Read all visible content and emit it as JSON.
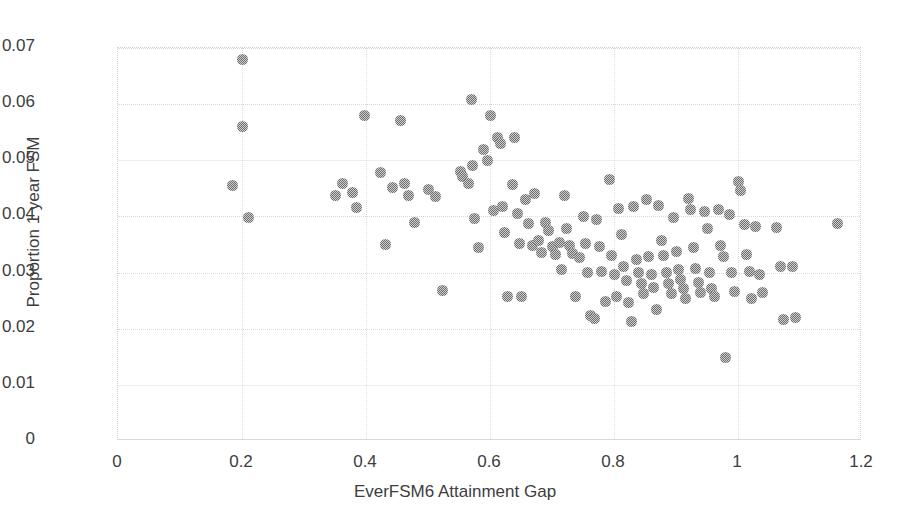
{
  "chart_data": {
    "type": "scatter",
    "title": "",
    "xlabel": "EverFSM6 Attainment Gap",
    "ylabel": "Proportion 1 year FSM",
    "xlim": [
      0,
      1.2
    ],
    "ylim": [
      0,
      0.07
    ],
    "xticks": [
      "0",
      "0.2",
      "0.4",
      "0.6",
      "0.8",
      "1",
      "1.2"
    ],
    "xtick_values": [
      0,
      0.2,
      0.4,
      0.6,
      0.8,
      1.0,
      1.2
    ],
    "yticks": [
      "0",
      "0.01",
      "0.02",
      "0.03",
      "0.04",
      "0.05",
      "0.06",
      "0.07"
    ],
    "ytick_values": [
      0,
      0.01,
      0.02,
      0.03,
      0.04,
      0.05,
      0.06,
      0.07
    ],
    "grid": true,
    "legend": false,
    "marker_color": "#6e6e6e",
    "marker_size_px": 11,
    "background_color": "#ffffff",
    "points": [
      [
        0.2,
        0.068
      ],
      [
        0.2,
        0.056
      ],
      [
        0.185,
        0.0455
      ],
      [
        0.211,
        0.0398
      ],
      [
        0.35,
        0.0438
      ],
      [
        0.362,
        0.0458
      ],
      [
        0.378,
        0.0443
      ],
      [
        0.385,
        0.0416
      ],
      [
        0.398,
        0.058
      ],
      [
        0.424,
        0.0478
      ],
      [
        0.432,
        0.035
      ],
      [
        0.443,
        0.0452
      ],
      [
        0.456,
        0.057
      ],
      [
        0.462,
        0.0458
      ],
      [
        0.468,
        0.0438
      ],
      [
        0.478,
        0.039
      ],
      [
        0.5,
        0.0448
      ],
      [
        0.512,
        0.0435
      ],
      [
        0.524,
        0.0268
      ],
      [
        0.552,
        0.048
      ],
      [
        0.556,
        0.0472
      ],
      [
        0.566,
        0.0459
      ],
      [
        0.572,
        0.049
      ],
      [
        0.57,
        0.0608
      ],
      [
        0.575,
        0.0396
      ],
      [
        0.582,
        0.0345
      ],
      [
        0.59,
        0.052
      ],
      [
        0.596,
        0.05
      ],
      [
        0.601,
        0.058
      ],
      [
        0.605,
        0.041
      ],
      [
        0.612,
        0.054
      ],
      [
        0.617,
        0.053
      ],
      [
        0.62,
        0.0418
      ],
      [
        0.624,
        0.0372
      ],
      [
        0.628,
        0.0258
      ],
      [
        0.636,
        0.0456
      ],
      [
        0.64,
        0.054
      ],
      [
        0.645,
        0.0405
      ],
      [
        0.648,
        0.0352
      ],
      [
        0.651,
        0.0258
      ],
      [
        0.658,
        0.043
      ],
      [
        0.662,
        0.0388
      ],
      [
        0.668,
        0.0349
      ],
      [
        0.672,
        0.044
      ],
      [
        0.678,
        0.0357
      ],
      [
        0.683,
        0.0336
      ],
      [
        0.69,
        0.039
      ],
      [
        0.695,
        0.0375
      ],
      [
        0.7,
        0.0346
      ],
      [
        0.706,
        0.0332
      ],
      [
        0.712,
        0.0353
      ],
      [
        0.716,
        0.0305
      ],
      [
        0.72,
        0.0437
      ],
      [
        0.724,
        0.0378
      ],
      [
        0.728,
        0.0348
      ],
      [
        0.733,
        0.0334
      ],
      [
        0.738,
        0.0258
      ],
      [
        0.744,
        0.0327
      ],
      [
        0.75,
        0.04
      ],
      [
        0.754,
        0.0352
      ],
      [
        0.758,
        0.03
      ],
      [
        0.762,
        0.0224
      ],
      [
        0.768,
        0.0218
      ],
      [
        0.772,
        0.0395
      ],
      [
        0.776,
        0.0347
      ],
      [
        0.78,
        0.0302
      ],
      [
        0.786,
        0.0249
      ],
      [
        0.792,
        0.0466
      ],
      [
        0.796,
        0.033
      ],
      [
        0.8,
        0.0296
      ],
      [
        0.804,
        0.0258
      ],
      [
        0.808,
        0.0414
      ],
      [
        0.812,
        0.0367
      ],
      [
        0.816,
        0.031
      ],
      [
        0.82,
        0.0285
      ],
      [
        0.824,
        0.0246
      ],
      [
        0.828,
        0.0213
      ],
      [
        0.832,
        0.0417
      ],
      [
        0.836,
        0.0324
      ],
      [
        0.84,
        0.03
      ],
      [
        0.844,
        0.0281
      ],
      [
        0.848,
        0.0262
      ],
      [
        0.852,
        0.043
      ],
      [
        0.856,
        0.0328
      ],
      [
        0.86,
        0.0296
      ],
      [
        0.864,
        0.0273
      ],
      [
        0.868,
        0.0234
      ],
      [
        0.872,
        0.042
      ],
      [
        0.876,
        0.0358
      ],
      [
        0.88,
        0.033
      ],
      [
        0.884,
        0.03
      ],
      [
        0.888,
        0.028
      ],
      [
        0.892,
        0.0262
      ],
      [
        0.896,
        0.0398
      ],
      [
        0.9,
        0.0338
      ],
      [
        0.904,
        0.0306
      ],
      [
        0.908,
        0.0288
      ],
      [
        0.912,
        0.0272
      ],
      [
        0.916,
        0.0253
      ],
      [
        0.92,
        0.0432
      ],
      [
        0.924,
        0.0412
      ],
      [
        0.928,
        0.0344
      ],
      [
        0.932,
        0.0308
      ],
      [
        0.936,
        0.0282
      ],
      [
        0.94,
        0.0265
      ],
      [
        0.946,
        0.0408
      ],
      [
        0.95,
        0.0378
      ],
      [
        0.954,
        0.03
      ],
      [
        0.958,
        0.0272
      ],
      [
        0.962,
        0.0258
      ],
      [
        0.968,
        0.0413
      ],
      [
        0.972,
        0.0348
      ],
      [
        0.976,
        0.0328
      ],
      [
        0.98,
        0.0148
      ],
      [
        0.986,
        0.0404
      ],
      [
        0.99,
        0.03
      ],
      [
        0.994,
        0.0266
      ],
      [
        1.0,
        0.0462
      ],
      [
        1.004,
        0.0446
      ],
      [
        1.01,
        0.0386
      ],
      [
        1.014,
        0.0332
      ],
      [
        1.018,
        0.0302
      ],
      [
        1.022,
        0.0254
      ],
      [
        1.028,
        0.0382
      ],
      [
        1.034,
        0.0296
      ],
      [
        1.04,
        0.0264
      ],
      [
        1.062,
        0.038
      ],
      [
        1.068,
        0.031
      ],
      [
        1.074,
        0.0216
      ],
      [
        1.088,
        0.031
      ],
      [
        1.092,
        0.022
      ],
      [
        1.16,
        0.0388
      ]
    ]
  }
}
